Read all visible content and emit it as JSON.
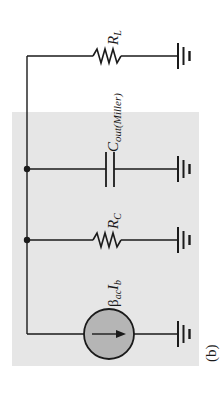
{
  "figure": {
    "label": "(b)",
    "background_color": "#ffffff",
    "shaded_region_color": "#e6e6e6",
    "wire_color": "#1a1a1a",
    "source_fill_color": "#b5b5b5"
  },
  "components": {
    "load_resistor": {
      "symbol": "R",
      "subscript": "L"
    },
    "miller_capacitor": {
      "symbol": "C",
      "subscript": "out(Miller)"
    },
    "collector_resistor": {
      "symbol": "R",
      "subscript": "C"
    },
    "current_source": {
      "greek": "β",
      "sub1": "ac",
      "symbol": "I",
      "sub2": "b"
    }
  }
}
